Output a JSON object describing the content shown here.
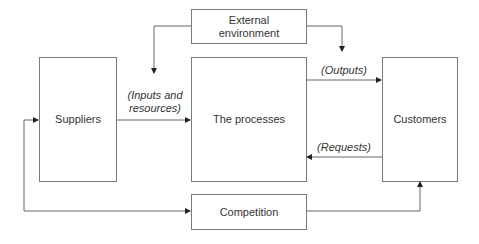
{
  "diagram": {
    "nodes": {
      "external_environment": "External\nenvironment",
      "suppliers": "Suppliers",
      "processes": "The processes",
      "customers": "Customers",
      "competition": "Competition"
    },
    "edge_labels": {
      "inputs_line1": "(Inputs and",
      "inputs_line2": "resources)",
      "outputs": "(Outputs)",
      "requests": "(Requests)"
    },
    "edges": [
      {
        "from": "external_environment",
        "to": "inputs_arrow"
      },
      {
        "from": "external_environment",
        "to": "outputs_arrow"
      },
      {
        "from": "suppliers",
        "to": "processes",
        "label": "(Inputs and resources)"
      },
      {
        "from": "processes",
        "to": "customers",
        "label": "(Outputs)"
      },
      {
        "from": "customers",
        "to": "processes",
        "label": "(Requests)"
      },
      {
        "from": "competition",
        "to": "suppliers"
      },
      {
        "from": "competition",
        "to": "customers"
      }
    ],
    "colors": {
      "line": "#555555",
      "border": "#7a7a7a",
      "text": "#333333"
    }
  }
}
